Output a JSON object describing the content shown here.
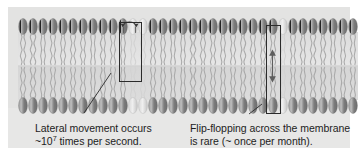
{
  "figure": {
    "panel_background": "#e3e3e2",
    "page_background": "#ffffff"
  },
  "membrane": {
    "description": "phospholipid bilayer with two opposed leaflets of oval head groups and wavy hydrocarbon tails",
    "head_color_dark": "#8e8e8e",
    "head_color_light": "#cfcfcf",
    "tail_color": "#b9b9b9",
    "interior_color": "#dedede",
    "leaflet_count": 2,
    "lipids_per_leaflet": 34
  },
  "annotations": {
    "lateral": {
      "box_label": "lateral-movement-highlight",
      "arrow_type": "curved-horizontal-double-arrow",
      "caption_line1": "Lateral movement occurs",
      "caption_line2_prefix": "~10",
      "caption_line2_exponent": "7",
      "caption_line2_suffix": " times per second."
    },
    "flipflop": {
      "box_label": "flip-flop-highlight",
      "arrow_type": "vertical-double-arrow",
      "caption_line1": "Flip-flopping across the membrane",
      "caption_line2": "is rare (~ once per month)."
    }
  },
  "colors": {
    "text": "#1d1d1d",
    "box_stroke": "#2b2b2b",
    "leader_stroke": "#2b2b2b"
  }
}
